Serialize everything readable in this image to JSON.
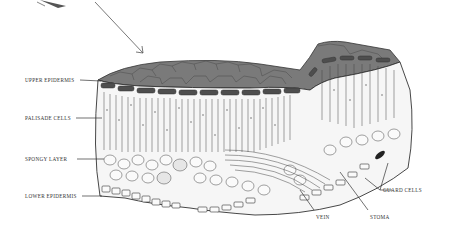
{
  "diagram": {
    "labels": [
      {
        "id": "upper-epidermis",
        "text": "UPPER EPIDERMIS",
        "x": 25,
        "y": 77
      },
      {
        "id": "palisade-cells",
        "text": "PALISADE CELLS",
        "x": 25,
        "y": 115
      },
      {
        "id": "spongy-layer",
        "text": "SPONGY LAYER",
        "x": 25,
        "y": 157
      },
      {
        "id": "lower-epidermis",
        "text": "LOWER EPIDERMIS",
        "x": 25,
        "y": 193
      },
      {
        "id": "vein",
        "text": "VEIN",
        "x": 316,
        "y": 215
      },
      {
        "id": "stoma",
        "text": "STOMA",
        "x": 370,
        "y": 215
      },
      {
        "id": "guard-cells",
        "text": "GUARD CELLS",
        "x": 382,
        "y": 188
      }
    ],
    "colors": {
      "line": "#333333",
      "epidermis_top": "#6b6b6b",
      "cell_fill": "#f4f4f4",
      "background": "#ffffff"
    }
  }
}
